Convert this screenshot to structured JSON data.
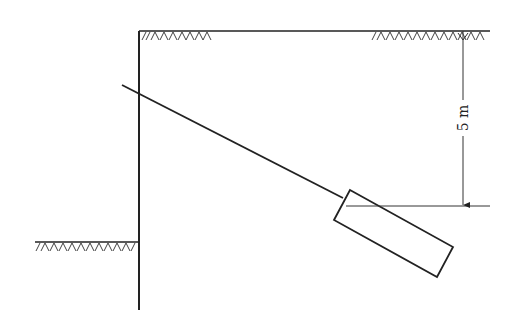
{
  "diagram": {
    "dimension": {
      "label": "5 m"
    },
    "elements": [
      "retaining-wall",
      "ground-surface-top",
      "ground-surface-excavation",
      "anchor-rod",
      "anchor-block",
      "dimension-line",
      "reference-level-line"
    ],
    "colors": {
      "line": "#222222",
      "background": "#ffffff"
    }
  }
}
